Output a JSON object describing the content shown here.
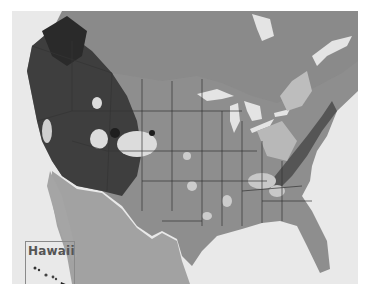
{
  "map": {
    "description": "Grayscale shaded-relief map of the contiguous United States with state boundaries and light highlighted regions",
    "colors": {
      "ocean": "#e9e9e9",
      "land": "#8c8c8c",
      "mountains": "#3a3a3a",
      "highlight": "#d6d6d6",
      "lakes": "#e4e4e4",
      "borders": "#333333"
    },
    "inset": {
      "label": "Hawaii"
    }
  }
}
